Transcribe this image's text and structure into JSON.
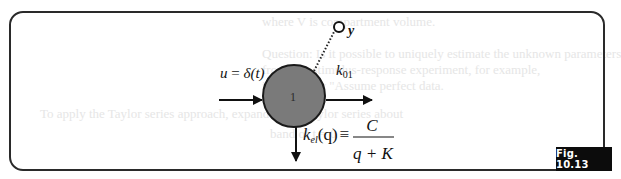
{
  "figure": {
    "label": "Fig. 10.13",
    "compartment": {
      "id": "1",
      "fill_color": "#7a7a7a",
      "border_color": "#1a1a1a"
    },
    "input": {
      "lhs": "u",
      "eq": " = ",
      "rhs": "δ(t)"
    },
    "output_rate": {
      "k": "k",
      "sub": "01"
    },
    "observation": {
      "label": "y"
    },
    "elimination": {
      "k": "k",
      "sub": "el",
      "arg": "(q)",
      "equiv": "≡",
      "numerator": "C",
      "denominator": "q + K"
    }
  },
  "background_bleed": {
    "lines": [
      "where V is compartment volume.",
      "Question: Is it possible to uniquely estimate the unknown parameters",
      "from this stimulus-response experiment, for example,",
      "i.e., are they \"Assume perfect data.",
      "To apply the Taylor series approach, expand q in a Taylor series about",
      "band of t = 0"
    ]
  }
}
